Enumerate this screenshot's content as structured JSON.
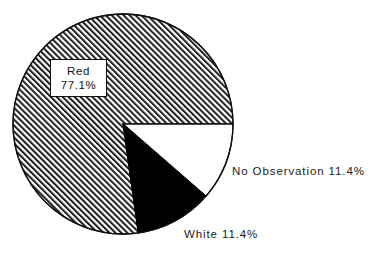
{
  "chart_data": {
    "type": "pie",
    "title": "",
    "subtitle": "",
    "xlabel": "",
    "ylabel": "",
    "legend_position": "on-slice-callout",
    "grid": false,
    "total_percent": "99.9",
    "units": "%",
    "start_angle_deg": 0,
    "direction": "clockwise",
    "categories": [
      "Red",
      "No Observation",
      "White"
    ],
    "values": [
      77.1,
      11.4,
      11.4
    ],
    "labels": [
      "Red 77.1%",
      "No Observation 11.4%",
      "White 11.4%"
    ],
    "slices": [
      {
        "name": "Red",
        "value": 77.1,
        "value_text": "77.1%",
        "label_line_1": "Red",
        "label_line_2": "77.1%",
        "fill_style": "diagonal-hatch",
        "fill_color": "#ffffff",
        "hatch_color": "#1a1a1a",
        "start_angle_deg": 82,
        "end_angle_deg": 360,
        "label_placement": "inside-boxed"
      },
      {
        "name": "No Observation",
        "value": 11.4,
        "value_text": "11.4%",
        "label_text": "No Observation 11.4%",
        "fill_style": "solid",
        "fill_color": "#ffffff",
        "start_angle_deg": 0,
        "end_angle_deg": 41,
        "label_placement": "outside-right"
      },
      {
        "name": "White",
        "value": 11.4,
        "value_text": "11.4%",
        "label_text": "White 11.4%",
        "fill_style": "solid",
        "fill_color": "#000000",
        "start_angle_deg": 41,
        "end_angle_deg": 82,
        "label_placement": "outside-bottom"
      }
    ],
    "geometry": {
      "center_x": 123,
      "center_y": 124,
      "radius": 110,
      "outline_color": "#111111",
      "outline_width": 1.3,
      "background": "#ffffff"
    }
  },
  "labels": {
    "red_line1": "Red",
    "red_line2": "77.1%",
    "no_observation": "No Observation 11.4%",
    "white": "White 11.4%"
  }
}
